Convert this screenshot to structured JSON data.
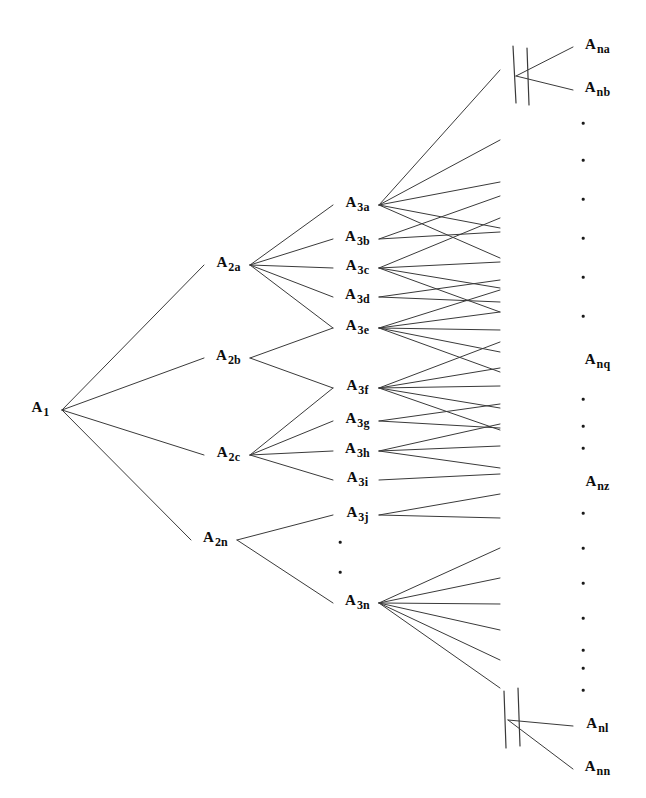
{
  "diagram": {
    "width": 646,
    "height": 798,
    "background_color": "#ffffff",
    "line_color": "#3a3a3a",
    "text_color": "#0d0d0d"
  },
  "nodes": [
    {
      "id": "A1",
      "base": "A",
      "sub": "1",
      "x": 40,
      "y": 407,
      "level": 1
    },
    {
      "id": "A2a",
      "base": "A",
      "sub": "2a",
      "x": 228,
      "y": 262,
      "level": 2
    },
    {
      "id": "A2b",
      "base": "A",
      "sub": "2b",
      "x": 228,
      "y": 355,
      "level": 2
    },
    {
      "id": "A2c",
      "base": "A",
      "sub": "2c",
      "x": 228,
      "y": 452,
      "level": 2
    },
    {
      "id": "A2n",
      "base": "A",
      "sub": "2n",
      "x": 215,
      "y": 537,
      "level": 2
    },
    {
      "id": "A3a",
      "base": "A",
      "sub": "3a",
      "x": 357,
      "y": 202,
      "level": 3
    },
    {
      "id": "A3b",
      "base": "A",
      "sub": "3b",
      "x": 357,
      "y": 236,
      "level": 3
    },
    {
      "id": "A3c",
      "base": "A",
      "sub": "3c",
      "x": 357,
      "y": 265,
      "level": 3
    },
    {
      "id": "A3d",
      "base": "A",
      "sub": "3d",
      "x": 357,
      "y": 294,
      "level": 3
    },
    {
      "id": "A3e",
      "base": "A",
      "sub": "3e",
      "x": 357,
      "y": 325,
      "level": 3
    },
    {
      "id": "A3f",
      "base": "A",
      "sub": "3f",
      "x": 357,
      "y": 385,
      "level": 3
    },
    {
      "id": "A3g",
      "base": "A",
      "sub": "3g",
      "x": 357,
      "y": 418,
      "level": 3
    },
    {
      "id": "A3h",
      "base": "A",
      "sub": "3h",
      "x": 357,
      "y": 448,
      "level": 3
    },
    {
      "id": "A3i",
      "base": "A",
      "sub": "3i",
      "x": 357,
      "y": 477,
      "level": 3
    },
    {
      "id": "A3j",
      "base": "A",
      "sub": "3j",
      "x": 357,
      "y": 512,
      "level": 3
    },
    {
      "id": "A3n",
      "base": "A",
      "sub": "3n",
      "x": 357,
      "y": 600,
      "level": 3
    },
    {
      "id": "Ana",
      "base": "A",
      "sub": "na",
      "x": 597,
      "y": 44,
      "level": "n"
    },
    {
      "id": "Anb",
      "base": "A",
      "sub": "nb",
      "x": 597,
      "y": 87,
      "level": "n"
    },
    {
      "id": "Anq",
      "base": "A",
      "sub": "nq",
      "x": 597,
      "y": 359,
      "level": "n"
    },
    {
      "id": "Anz",
      "base": "A",
      "sub": "nz",
      "x": 597,
      "y": 481,
      "level": "n"
    },
    {
      "id": "Anl",
      "base": "A",
      "sub": "nl",
      "x": 597,
      "y": 723,
      "level": "n"
    },
    {
      "id": "Ann",
      "base": "A",
      "sub": "nn",
      "x": 597,
      "y": 766,
      "level": "n"
    }
  ],
  "level3_ellipsis": [
    {
      "x": 340,
      "y": 542
    },
    {
      "x": 340,
      "y": 572
    }
  ],
  "right_ellipsis": [
    {
      "x": 583,
      "y": 123
    },
    {
      "x": 583,
      "y": 160
    },
    {
      "x": 583,
      "y": 199
    },
    {
      "x": 583,
      "y": 238
    },
    {
      "x": 583,
      "y": 277
    },
    {
      "x": 583,
      "y": 316
    },
    {
      "x": 583,
      "y": 399
    },
    {
      "x": 583,
      "y": 426
    },
    {
      "x": 583,
      "y": 448
    },
    {
      "x": 583,
      "y": 513
    },
    {
      "x": 583,
      "y": 548
    },
    {
      "x": 583,
      "y": 583
    },
    {
      "x": 583,
      "y": 618
    },
    {
      "x": 583,
      "y": 650
    },
    {
      "x": 583,
      "y": 668
    },
    {
      "x": 583,
      "y": 690
    }
  ],
  "break_marks": [
    {
      "name": "top-break-left",
      "x1": 513,
      "y1": 46,
      "x2": 516,
      "y2": 103
    },
    {
      "name": "top-break-right",
      "x1": 527,
      "y1": 48,
      "x2": 529,
      "y2": 105
    },
    {
      "name": "bottom-break-left",
      "x1": 504,
      "y1": 691,
      "x2": 506,
      "y2": 748
    },
    {
      "name": "bottom-break-right",
      "x1": 518,
      "y1": 688,
      "x2": 520,
      "y2": 746
    }
  ],
  "edges": {
    "level1_to_level2": [
      {
        "from": "A1",
        "to": "A2a"
      },
      {
        "from": "A1",
        "to": "A2b"
      },
      {
        "from": "A1",
        "to": "A2c"
      },
      {
        "from": "A1",
        "to": "A2n"
      }
    ],
    "level2_to_level3": [
      {
        "from": "A2a",
        "to": "A3a"
      },
      {
        "from": "A2a",
        "to": "A3b"
      },
      {
        "from": "A2a",
        "to": "A3c"
      },
      {
        "from": "A2a",
        "to": "A3d"
      },
      {
        "from": "A2a",
        "to": "A3e"
      },
      {
        "from": "A2b",
        "to": "A3e"
      },
      {
        "from": "A2b",
        "to": "A3f"
      },
      {
        "from": "A2c",
        "to": "A3f"
      },
      {
        "from": "A2c",
        "to": "A3g"
      },
      {
        "from": "A2c",
        "to": "A3h"
      },
      {
        "from": "A2c",
        "to": "A3i"
      },
      {
        "from": "A2n",
        "to": "A3j"
      },
      {
        "from": "A2n",
        "to": "A3n"
      }
    ],
    "level3_fans": [
      {
        "from": "A3a",
        "targets_y": [
          70,
          140,
          182,
          228,
          258
        ]
      },
      {
        "from": "A3b",
        "targets_y": [
          196,
          232
        ]
      },
      {
        "from": "A3c",
        "targets_y": [
          218,
          262,
          288,
          312
        ]
      },
      {
        "from": "A3d",
        "targets_y": [
          280,
          302
        ]
      },
      {
        "from": "A3e",
        "targets_y": [
          290,
          312,
          330,
          352,
          372
        ]
      },
      {
        "from": "A3f",
        "targets_y": [
          342,
          368,
          386,
          408,
          430
        ]
      },
      {
        "from": "A3g",
        "targets_y": [
          404,
          428
        ]
      },
      {
        "from": "A3h",
        "targets_y": [
          424,
          446,
          468
        ]
      },
      {
        "from": "A3i",
        "targets_y": [
          474
        ]
      },
      {
        "from": "A3j",
        "targets_y": [
          494,
          518
        ]
      },
      {
        "from": "A3n",
        "targets_y": [
          548,
          578,
          604,
          630,
          660,
          688
        ]
      }
    ],
    "terminal_fans": [
      {
        "from_x": 516,
        "from_y": 76,
        "to": "Ana"
      },
      {
        "from_x": 516,
        "from_y": 76,
        "to": "Anb"
      },
      {
        "from_x": 508,
        "from_y": 720,
        "to": "Anl"
      },
      {
        "from_x": 508,
        "from_y": 720,
        "to": "Ann"
      }
    ],
    "fan_right_x": 500
  }
}
